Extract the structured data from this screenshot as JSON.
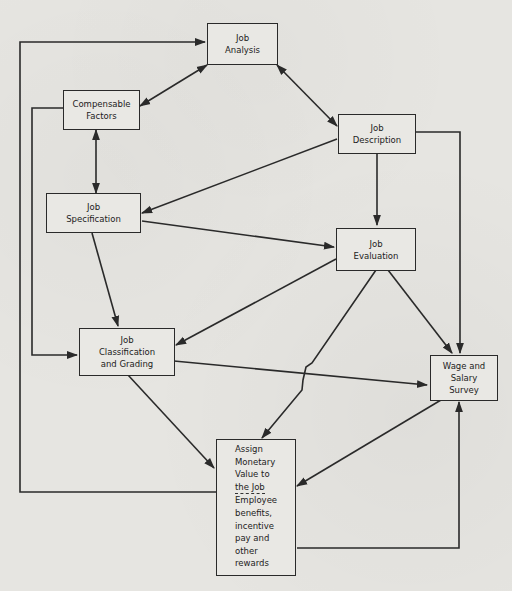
{
  "diagram": {
    "title": "",
    "nodes": {
      "job_analysis": {
        "line1": "Job",
        "line2": "Analysis"
      },
      "compensable_factors": {
        "line1": "Compensable",
        "line2": "Factors"
      },
      "job_description": {
        "line1": "Job",
        "line2": "Description"
      },
      "job_specification": {
        "line1": "Job",
        "line2": "Specification"
      },
      "job_evaluation": {
        "line1": "Job",
        "line2": "Evaluation"
      },
      "job_classification": {
        "line1": "Job",
        "line2": "Classification",
        "line3": "and Grading"
      },
      "wage_salary_survey": {
        "line1": "Wage and",
        "line2": "Salary",
        "line3": "Survey"
      },
      "assign_monetary_value": {
        "lines": [
          "Assign",
          "Monetary",
          "Value to",
          "the Job",
          "Employee",
          "benefits,",
          "incentive",
          "pay and",
          "other",
          "rewards"
        ]
      }
    },
    "edges": [
      {
        "from": "Job Analysis",
        "to": "Compensable Factors",
        "type": "bidirectional"
      },
      {
        "from": "Job Analysis",
        "to": "Job Description",
        "type": "bidirectional"
      },
      {
        "from": "Compensable Factors",
        "to": "Job Specification",
        "type": "bidirectional"
      },
      {
        "from": "Compensable Factors",
        "to": "Job Classification and Grading",
        "type": "directed"
      },
      {
        "from": "Job Description",
        "to": "Job Specification",
        "type": "directed"
      },
      {
        "from": "Job Description",
        "to": "Job Evaluation",
        "type": "directed"
      },
      {
        "from": "Job Description",
        "to": "Wage and Salary Survey",
        "type": "directed"
      },
      {
        "from": "Job Specification",
        "to": "Job Evaluation",
        "type": "directed"
      },
      {
        "from": "Job Specification",
        "to": "Job Classification and Grading",
        "type": "directed"
      },
      {
        "from": "Job Evaluation",
        "to": "Job Classification and Grading",
        "type": "directed"
      },
      {
        "from": "Job Evaluation",
        "to": "Wage and Salary Survey",
        "type": "directed"
      },
      {
        "from": "Job Evaluation",
        "to": "Assign Monetary Value to the Job",
        "type": "directed"
      },
      {
        "from": "Job Classification and Grading",
        "to": "Wage and Salary Survey",
        "type": "directed"
      },
      {
        "from": "Job Classification and Grading",
        "to": "Assign Monetary Value to the Job",
        "type": "directed"
      },
      {
        "from": "Wage and Salary Survey",
        "to": "Assign Monetary Value to the Job",
        "type": "directed"
      },
      {
        "from": "Assign Monetary Value to the Job",
        "to": "Employee benefits, incentive pay and other rewards",
        "type": "directed"
      },
      {
        "from": "Assign Monetary Value to the Job",
        "to": "Job Analysis",
        "type": "directed",
        "note": "feedback loop"
      },
      {
        "from": "Employee benefits, incentive pay and other rewards",
        "to": "Wage and Salary Survey",
        "type": "directed",
        "note": "feedback loop"
      }
    ],
    "colors": {
      "background": "#e6e5e1",
      "line": "#2a2a2a",
      "text": "#222222"
    }
  }
}
